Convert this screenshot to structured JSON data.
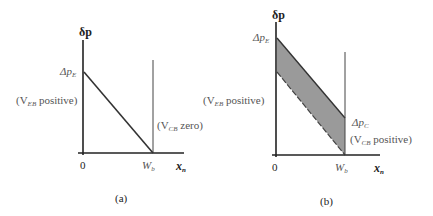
{
  "panels": [
    {
      "id": "a",
      "caption": "(a)",
      "y_axis_label": "δp",
      "x_axis_label": "x",
      "x_axis_sub": "n",
      "origin_label": "0",
      "wb_label": "W",
      "wb_sub": "b",
      "delta_label": "Δp",
      "delta_sub": "E",
      "left_note_pre": "(V",
      "left_note_sub": "EB",
      "left_note_post": " positive)",
      "right_note_pre": "(V",
      "right_note_sub": "CB",
      "right_note_post": " zero)"
    },
    {
      "id": "b",
      "caption": "(b)",
      "y_axis_label": "δp",
      "x_axis_label": "x",
      "x_axis_sub": "n",
      "origin_label": "0",
      "wb_label": "W",
      "wb_sub": "b",
      "delta_e_label": "Δp",
      "delta_e_sub": "E",
      "delta_c_label": "Δp",
      "delta_c_sub": "C",
      "left_note_pre": "(V",
      "left_note_sub": "EB",
      "left_note_post": " positive)",
      "right_note_pre": "(V",
      "right_note_sub": "CB",
      "right_note_post": " positive)"
    }
  ],
  "colors": {
    "axis": "#222222",
    "line": "#333333",
    "shade": "#9a9a9a",
    "label": "#555555"
  }
}
